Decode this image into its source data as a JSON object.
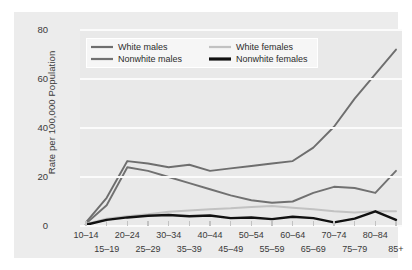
{
  "chart_data": {
    "type": "line",
    "title": "",
    "xlabel": "",
    "ylabel": "Rate per 100,000 Population",
    "ylim": [
      0,
      80
    ],
    "yticks": [
      0,
      20,
      40,
      60,
      80
    ],
    "grid": true,
    "legend_position": "top-left",
    "categories": [
      "10–14",
      "15–19",
      "20–24",
      "25–29",
      "30–34",
      "35–39",
      "40–44",
      "45–49",
      "50–54",
      "55–59",
      "60–64",
      "65–69",
      "70–74",
      "75–79",
      "80–84",
      "85+"
    ],
    "series": [
      {
        "name": "White males",
        "color": "#6e6e6e",
        "width": 1.9,
        "values": [
          1.5,
          11.5,
          26.5,
          25.5,
          24.0,
          25.0,
          22.5,
          23.5,
          24.5,
          25.5,
          26.5,
          32.0,
          40.5,
          52.0,
          62.0,
          72.0
        ]
      },
      {
        "name": "Nonwhite males",
        "color": "#717171",
        "width": 1.9,
        "values": [
          1.0,
          8.5,
          24.0,
          22.5,
          20.0,
          17.5,
          15.0,
          12.5,
          10.5,
          9.5,
          10.0,
          13.5,
          16.0,
          15.5,
          13.5,
          22.5
        ]
      },
      {
        "name": "White females",
        "color": "#c2c2c2",
        "width": 2.0,
        "values": [
          0.8,
          3.0,
          4.0,
          4.8,
          5.8,
          6.3,
          6.8,
          7.2,
          7.8,
          8.2,
          7.5,
          6.8,
          6.0,
          5.5,
          6.0,
          6.0
        ]
      },
      {
        "name": "Nonwhite females",
        "color": "#111111",
        "width": 2.4,
        "values": [
          0.5,
          2.5,
          3.5,
          4.2,
          4.5,
          4.0,
          4.3,
          3.2,
          3.5,
          2.8,
          3.8,
          3.2,
          1.5,
          3.0,
          6.0,
          2.5
        ]
      }
    ]
  },
  "legend": {
    "items": [
      {
        "label": "White males",
        "swatch": "legend-swatch-white-males"
      },
      {
        "label": "White females",
        "swatch": "legend-swatch-white-females"
      },
      {
        "label": "Nonwhite males",
        "swatch": "legend-swatch-nonwhite-males"
      },
      {
        "label": "Nonwhite females",
        "swatch": "legend-swatch-nonwhite-females"
      }
    ]
  }
}
